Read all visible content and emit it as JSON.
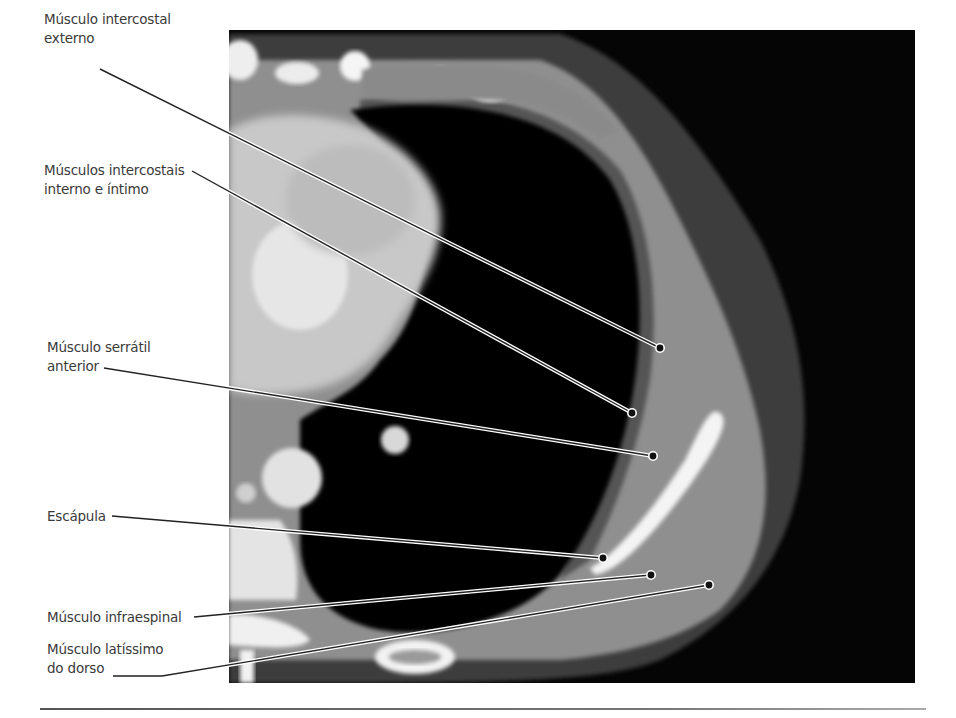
{
  "figure": {
    "type": "axial CT scan of the thorax with anatomical labels",
    "background": "#ffffff",
    "scan_background": "#050505"
  },
  "labels": [
    {
      "id": "intercostal-externo",
      "lines": [
        "Músculo intercostal",
        "externo"
      ],
      "x": 44,
      "y": 10,
      "leader": [
        [
          100,
          69
        ],
        [
          660,
          348
        ]
      ]
    },
    {
      "id": "intercostais-interno-intimo",
      "lines": [
        "Músculos intercostais",
        "interno e íntimo"
      ],
      "x": 44,
      "y": 161,
      "leader": [
        [
          192,
          171
        ],
        [
          632,
          413
        ]
      ]
    },
    {
      "id": "serratil-anterior",
      "lines": [
        "Músculo serrátil",
        "anterior"
      ],
      "x": 47,
      "y": 338,
      "leader": [
        [
          104,
          368
        ],
        [
          653,
          456
        ]
      ]
    },
    {
      "id": "escapula",
      "lines": [
        "Escápula"
      ],
      "x": 47,
      "y": 507,
      "leader": [
        [
          112,
          516
        ],
        [
          603,
          558
        ]
      ]
    },
    {
      "id": "infraespinal",
      "lines": [
        "Músculo infraespinal"
      ],
      "x": 47,
      "y": 608,
      "leader": [
        [
          194,
          617
        ],
        [
          651,
          575
        ]
      ]
    },
    {
      "id": "latissimo-dorso",
      "lines": [
        "Músculo latíssimo",
        "do dorso"
      ],
      "x": 47,
      "y": 640,
      "leader": [
        [
          113,
          676
        ],
        [
          162,
          676
        ],
        [
          709,
          585
        ]
      ]
    }
  ]
}
